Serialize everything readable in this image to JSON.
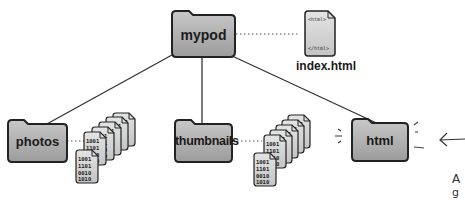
{
  "diagram": {
    "root": {
      "label": "mypod"
    },
    "root_file": {
      "label": "index.html",
      "open_tag": "<html>",
      "close_tag": "</html>"
    },
    "children": [
      {
        "label": "photos",
        "has_files": true
      },
      {
        "label": "thumbnails",
        "has_files": true
      },
      {
        "label": "html",
        "highlighted": true,
        "has_files": false
      }
    ],
    "file_glyph_lines": [
      "1001",
      "110100",
      "001010",
      "101011"
    ],
    "annotation": {
      "arrow": "left-arrow",
      "text_line1": "A",
      "text_line2": "g"
    }
  },
  "colors": {
    "folder_fill": "#b3b3b3",
    "folder_stroke": "#222222",
    "line": "#333333",
    "doc_fill": "#d9d9d9"
  }
}
